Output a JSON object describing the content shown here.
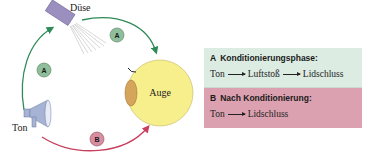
{
  "diagram": {
    "labels": {
      "nozzle": "Düse",
      "eye": "Auge",
      "tone": "Ton"
    },
    "badges": {
      "path_tone_to_nozzle": "A",
      "path_nozzle_to_eye": "A",
      "path_tone_to_eye": "B"
    },
    "colors": {
      "path_a": "#2e8b57",
      "path_b": "#c9405e",
      "badge_a_fill": "#8fbf9a",
      "badge_b_fill": "#d98ea0",
      "eye_fill": "#f7ef8c",
      "iris_fill": "#d6a55c",
      "nozzle_fill": "#9b8fc0",
      "megaphone_fill": "#a7b3d4"
    }
  },
  "legend": {
    "phase_a": {
      "letter": "A",
      "title": "Konditionierungsphase:",
      "sequence": [
        "Ton",
        "Luftstoß",
        "Lidschluss"
      ],
      "color": "#dcece3"
    },
    "phase_b": {
      "letter": "B",
      "title": "Nach Konditionierung:",
      "sequence": [
        "Ton",
        "Lidschluss"
      ],
      "color": "#dca1b0"
    }
  }
}
